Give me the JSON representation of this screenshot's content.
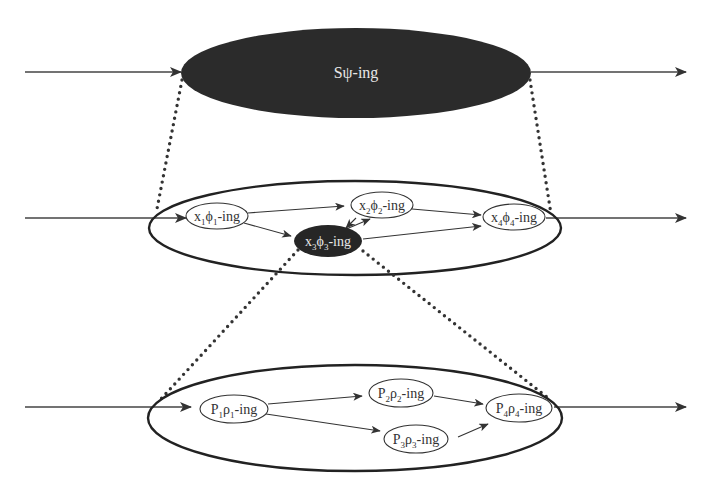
{
  "diagram": {
    "type": "hierarchical nested process diagram",
    "levels": [
      {
        "id": "top",
        "style": "filled-dark",
        "label": "Sψ-ing",
        "nodes": []
      },
      {
        "id": "middle",
        "style": "outline",
        "nodes": [
          {
            "id": "x1",
            "base": "x",
            "sub1": "1",
            "sym": "ϕ",
            "sub2": "1",
            "suffix": "-ing",
            "filled": false
          },
          {
            "id": "x2",
            "base": "x",
            "sub1": "2",
            "sym": "ϕ",
            "sub2": "2",
            "suffix": "-ing",
            "filled": false
          },
          {
            "id": "x3",
            "base": "x",
            "sub1": "3",
            "sym": "ϕ",
            "sub2": "3",
            "suffix": "-ing",
            "filled": true
          },
          {
            "id": "x4",
            "base": "x",
            "sub1": "4",
            "sym": "ϕ",
            "sub2": "4",
            "suffix": "-ing",
            "filled": false
          }
        ],
        "edges": [
          [
            "x1",
            "x2"
          ],
          [
            "x1",
            "x3"
          ],
          [
            "x2",
            "x3"
          ],
          [
            "x3",
            "x2"
          ],
          [
            "x2",
            "x4"
          ],
          [
            "x3",
            "x4"
          ]
        ]
      },
      {
        "id": "bottom",
        "style": "outline",
        "nodes": [
          {
            "id": "p1",
            "base": "P",
            "sub1": "1",
            "sym": "ρ",
            "sub2": "1",
            "suffix": "-ing"
          },
          {
            "id": "p2",
            "base": "P",
            "sub1": "2",
            "sym": "ρ",
            "sub2": "2",
            "suffix": "-ing"
          },
          {
            "id": "p3",
            "base": "P",
            "sub1": "3",
            "sym": "ρ",
            "sub2": "3",
            "suffix": "-ing"
          },
          {
            "id": "p4",
            "base": "P",
            "sub1": "4",
            "sym": "ρ",
            "sub2": "4",
            "suffix": "-ing"
          }
        ],
        "edges": [
          [
            "p1",
            "p2"
          ],
          [
            "p1",
            "p3"
          ],
          [
            "p2",
            "p4"
          ],
          [
            "p3",
            "p4"
          ]
        ]
      }
    ],
    "zoom_links": [
      {
        "from": "top",
        "to": "middle",
        "style": "dotted"
      },
      {
        "from": "x3",
        "to": "bottom",
        "style": "dotted"
      }
    ]
  }
}
